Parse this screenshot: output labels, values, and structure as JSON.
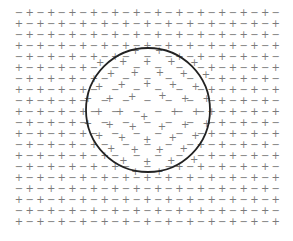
{
  "diagram": {
    "width": 293,
    "height": 241,
    "background": "#ffffff",
    "glyph_color": "#7a7a7a",
    "circle_color": "#222222",
    "grid": {
      "rows": 20,
      "cols": 25,
      "x0": 19,
      "y0": 12,
      "dx": 10.7,
      "dy": 11,
      "first_row_starts_with": "−",
      "symbols": {
        "positive": "+",
        "negative": "−"
      }
    },
    "circle": {
      "cx": 148,
      "cy": 110,
      "r": 62,
      "stroke_width": 1.8
    },
    "displacement": {
      "applies_to": "positive charges inside circle",
      "direction": "radially outward",
      "magnitude_px": 6
    }
  }
}
